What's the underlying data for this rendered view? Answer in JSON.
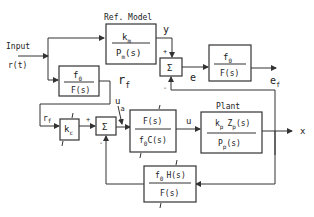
{
  "diagram": {
    "input_label": "Input",
    "input_signal": "r(t)",
    "ref_model": {
      "title": "Ref. Model",
      "num": "k",
      "num_sub": "m",
      "den": "P",
      "den_sub": "m",
      "den_tail": "(s)"
    },
    "filter_top": {
      "num": "f",
      "num_sub": "0",
      "den": "F(s)"
    },
    "filter_error": {
      "num": "f",
      "num_sub": "0",
      "den": "F(s)"
    },
    "sum_symbol": "Σ",
    "sum_top": {
      "plus": "+",
      "minus": "-"
    },
    "sum_bottom": {
      "plus": "+",
      "minus": "-"
    },
    "gain": {
      "label": "k",
      "sub": "c"
    },
    "controller": {
      "num": "F(s)",
      "den": "f",
      "den_sub": "0",
      "den_tail": "C(s)"
    },
    "plant": {
      "title": "Plant",
      "num_a": "k",
      "num_a_sub": "p",
      "num_b": "Z",
      "num_b_sub": "p",
      "num_tail": "(s)",
      "den": "P",
      "den_sub": "p",
      "den_tail": "(s)"
    },
    "feedback": {
      "num": "f",
      "num_sub": "0",
      "num_tail": "H(s)",
      "den": "F(s)"
    },
    "signals": {
      "y": "y",
      "e": "e",
      "ef": "e",
      "ef_sub": "f",
      "rf": "r",
      "rf_sub": "f",
      "rf2": "r",
      "rf2_sub": "f",
      "ua": "u",
      "ua_sub": "a",
      "u": "u",
      "x": "x"
    }
  }
}
